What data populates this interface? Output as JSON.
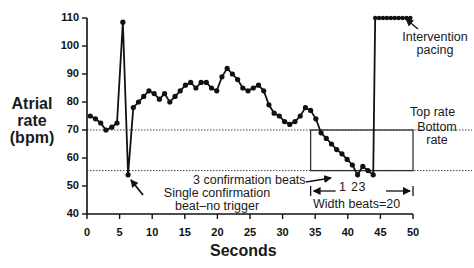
{
  "chart_data": {
    "type": "line",
    "title": "",
    "xlabel": "Seconds",
    "ylabel": "Atrial rate (bpm)",
    "xlim": [
      0,
      50
    ],
    "ylim": [
      40,
      110
    ],
    "xticks": [
      0,
      5,
      10,
      15,
      20,
      25,
      30,
      35,
      40,
      45,
      50
    ],
    "yticks": [
      40,
      50,
      60,
      70,
      80,
      90,
      100,
      110
    ],
    "grid": false,
    "series": [
      {
        "name": "Atrial rate",
        "x": [
          0.5,
          1.3,
          2.1,
          2.9,
          3.8,
          4.6,
          5.5,
          6.3,
          7.1,
          7.9,
          8.7,
          9.5,
          10.3,
          11.1,
          11.9,
          12.7,
          13.5,
          14.3,
          15.1,
          15.9,
          16.7,
          17.5,
          18.3,
          19.1,
          19.9,
          20.7,
          21.5,
          22.3,
          23.1,
          23.9,
          24.7,
          25.5,
          26.3,
          27.1,
          27.9,
          28.7,
          29.5,
          30.3,
          31.1,
          31.9,
          32.7,
          33.5,
          34.3,
          35.1,
          35.9,
          36.7,
          37.5,
          38.3,
          39.1,
          39.9,
          40.7,
          41.5,
          42.3,
          43.1,
          43.9
        ],
        "y": [
          75,
          74,
          72.5,
          70,
          71,
          72.5,
          108.5,
          54,
          78,
          80,
          82,
          84,
          83,
          81,
          83,
          80,
          82,
          84,
          86,
          87,
          85,
          87,
          87,
          85,
          84,
          89,
          92,
          90,
          88,
          85,
          84,
          85,
          86,
          84,
          79,
          76,
          75,
          73,
          72,
          73,
          75,
          78,
          77,
          74,
          69,
          67,
          65,
          63,
          61.5,
          59.5,
          57.5,
          54,
          57,
          55.5,
          54
        ]
      },
      {
        "name": "Intervention pacing",
        "x": [
          44.2,
          44.8,
          45.4,
          46.0,
          46.6,
          47.2,
          47.8,
          48.4,
          49.0,
          49.6
        ],
        "y": [
          110,
          110,
          110,
          110,
          110,
          110,
          110,
          110,
          110,
          110
        ]
      }
    ],
    "reference_lines": [
      {
        "name": "Top rate",
        "y": 70,
        "style": "dotted"
      },
      {
        "name": "Bottom rate",
        "y": 55.5,
        "style": "dotted"
      }
    ],
    "box": {
      "x0": 34.3,
      "x1": 50,
      "y0": 55.5,
      "y1": 70
    },
    "annotations": [
      {
        "text": "Intervention pacing",
        "x": 48,
        "y": 110
      },
      {
        "text": "Top rate",
        "x": 50,
        "y": 72
      },
      {
        "text": "Bottom rate",
        "x": 50,
        "y": 63
      },
      {
        "text": "3 confirmation beats",
        "x": 40,
        "y": 54
      },
      {
        "text": "1",
        "x": 41.5,
        "y": 50
      },
      {
        "text": "2",
        "x": 43,
        "y": 50
      },
      {
        "text": "3",
        "x": 44,
        "y": 50
      },
      {
        "text": "Single confirmation beat–no trigger",
        "x": 7,
        "y": 54
      },
      {
        "text": "Width beats=20",
        "x": 42,
        "y": 44
      }
    ]
  },
  "labels": {
    "ylabel_line1": "Atrial",
    "ylabel_line2": "rate",
    "ylabel_line3": "(bpm)",
    "xlabel": "Seconds",
    "intervention_line1": "Intervention",
    "intervention_line2": "pacing",
    "top_rate": "Top rate",
    "bottom_rate_line1": "Bottom",
    "bottom_rate_line2": "rate",
    "three_confirm": "3 confirmation beats",
    "single_confirm_line1": "Single confirmation",
    "single_confirm_line2": "beat–no trigger",
    "width_beats": "Width beats=20",
    "beat_1": "1",
    "beat_23": "23"
  },
  "colors": {
    "line": "#111111",
    "axis": "#111111",
    "reference": "#444444",
    "box": "#333333"
  }
}
